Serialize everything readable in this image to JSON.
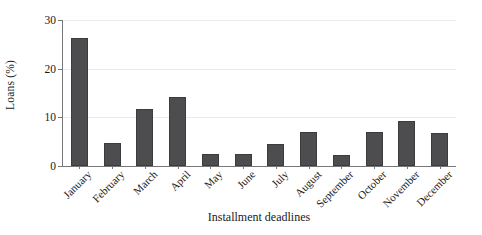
{
  "chart_data": {
    "type": "bar",
    "title": "",
    "xlabel": "Installment deadlines",
    "ylabel": "Loans (%)",
    "categories": [
      "January",
      "February",
      "March",
      "April",
      "May",
      "June",
      "July",
      "August",
      "September",
      "October",
      "November",
      "December"
    ],
    "values": [
      26.3,
      4.8,
      11.8,
      14.1,
      2.4,
      2.4,
      4.6,
      6.9,
      2.3,
      6.9,
      9.2,
      6.8
    ],
    "series": [
      {
        "name": "Loans (%)",
        "values": [
          26.3,
          4.8,
          11.8,
          14.1,
          2.4,
          2.4,
          4.6,
          6.9,
          2.3,
          6.9,
          9.2,
          6.8
        ]
      }
    ],
    "ylim": [
      0,
      30
    ],
    "yticks": [
      0,
      10,
      20,
      30
    ],
    "ytick_labels": [
      "0",
      "10",
      "20",
      "30"
    ],
    "grid": true,
    "grid_axis": "y",
    "legend": false,
    "legend_position": "none",
    "bar_color": "#4d4d4f",
    "bar_edge_color": "#3c3c3e",
    "axis_color": "#77777a",
    "gridline_color": "#ebebeb",
    "background": "#ffffff",
    "xtick_label_rotation": -45
  }
}
